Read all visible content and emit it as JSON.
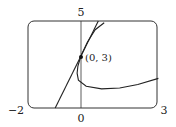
{
  "chart_data": {
    "type": "line",
    "title": "",
    "xlabel": "",
    "ylabel": "",
    "xlim": [
      -2,
      3
    ],
    "ylim": [
      0,
      5
    ],
    "grid": false,
    "tick_labels": {
      "x_left": "−2",
      "x_zero": "0",
      "x_right": "3",
      "y_top": "5"
    },
    "series": [
      {
        "name": "curve",
        "points": [
          [
            0.9,
            4.9
          ],
          [
            0.55,
            4.5
          ],
          [
            0.25,
            3.8
          ],
          [
            0.0,
            3.0
          ],
          [
            -0.12,
            2.4
          ],
          [
            -0.15,
            2.0
          ],
          [
            -0.1,
            1.6
          ],
          [
            0.2,
            1.25
          ],
          [
            0.8,
            1.1
          ],
          [
            1.5,
            1.15
          ],
          [
            2.2,
            1.35
          ],
          [
            3.0,
            1.7
          ]
        ]
      },
      {
        "name": "tangent line",
        "points": [
          [
            -1.0,
            0.0
          ],
          [
            0.67,
            5.0
          ]
        ],
        "slope": 3,
        "intercept": 3
      }
    ],
    "annotations": [
      {
        "label": "(0, 3)",
        "x": 0,
        "y": 3
      }
    ]
  }
}
